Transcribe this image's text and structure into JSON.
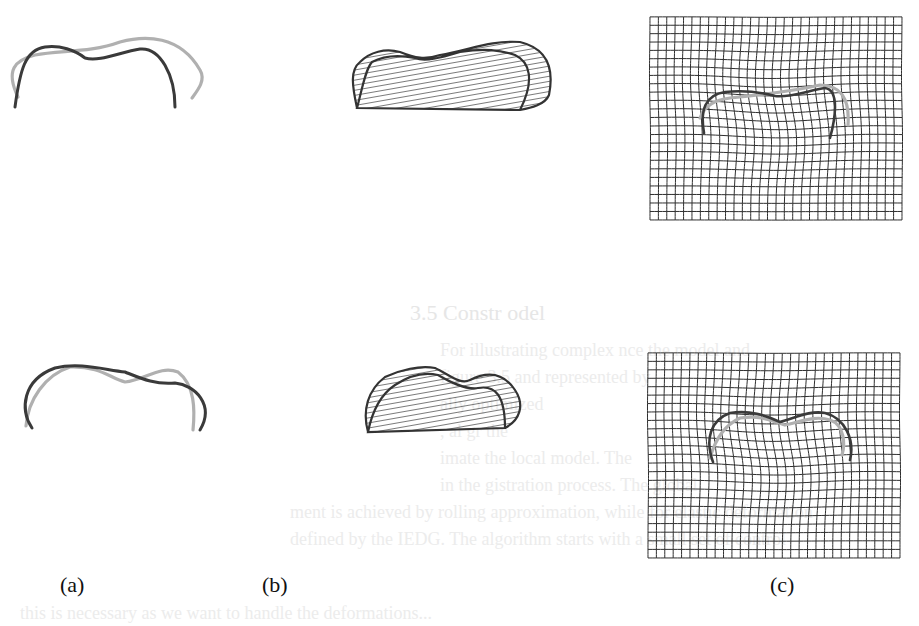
{
  "figure": {
    "panel_labels": [
      "(a)",
      "(b)",
      "(c)"
    ],
    "colors": {
      "source_curve": "#3a3a3a",
      "target_curve": "#b0b0b0",
      "grid_line": "#2e2e2e",
      "hatch": "#333333",
      "bleed_text": "#ececec"
    },
    "grid": {
      "columns": 30,
      "rows": 24
    },
    "rows": [
      {
        "name": "row-1",
        "panel_a": {
          "source_path": "M15,107 C20,70 25,50 45,47 C60,45 75,50 85,58 C100,62 120,52 140,49 C160,47 175,75 175,107",
          "target_path": "M18,97 C5,70 15,60 35,55 C60,50 90,53 120,42 C145,35 180,35 200,70 C206,80 198,90 192,98"
        },
        "panel_b": {
          "outer_path": "M357,108 C352,85 350,70 360,62 C370,52 385,48 400,52 C415,58 425,60 440,55 C470,50 490,40 520,42 C545,48 555,65 549,95 C545,105 530,108 520,110",
          "inner_path": "M357,108 C362,90 365,70 372,62 C385,55 400,55 415,58 C425,62 440,58 460,52 C485,48 500,50 515,55 C530,62 535,80 520,110"
        },
        "panel_c": {
          "x": 650,
          "y": 17,
          "w": 252,
          "h": 203,
          "source_path": "M704,133 C700,110 705,95 725,92 C745,90 760,92 775,96 C790,98 810,90 825,88 C840,90 835,120 830,138",
          "target_path": "M700,118 C705,105 715,100 730,98 C760,95 790,92 820,85 C840,85 850,98 848,125"
        }
      },
      {
        "name": "row-2",
        "panel_a": {
          "source_path": "M32,428 C20,410 22,380 55,368 C80,362 105,370 125,372 C140,378 155,385 175,383 C195,385 215,405 200,430",
          "target_path": "M26,426 C28,400 45,375 70,367 C100,366 110,378 125,382 C145,380 160,365 178,372 C195,385 195,410 193,430"
        },
        "panel_b": {
          "outer_path": "M368,432 C362,410 368,390 385,377 C400,370 420,365 435,368 C450,375 460,385 470,380 C490,370 505,375 515,390 C525,405 520,420 505,428",
          "inner_path": "M368,432 C372,412 380,395 395,385 C410,375 425,372 438,375 C450,382 465,390 478,388 C495,385 505,395 505,428"
        },
        "panel_c": {
          "x": 648,
          "y": 353,
          "w": 252,
          "h": 205,
          "source_path": "M713,462 C705,440 710,420 730,413 C750,410 765,415 780,422 C795,418 810,410 825,413 C845,418 855,440 850,460",
          "target_path": "M710,458 C715,440 725,425 740,418 C760,415 770,420 785,425 C800,422 815,415 830,420 C845,425 845,445 842,455"
        }
      }
    ],
    "bleed_through_text": {
      "heading": "3.5 Constr          odel",
      "lines": [
        "For illustrating complex              nce the model and",
        "figure 3.5 and            represented by",
        "            ally         optimized",
        "          ,             al gr         the",
        "         imate the                  local model. The",
        "         in the                      gistration process. The global",
        "  ment is achieved by rolling approximation, while for elastic deformation",
        "  defined by the IEDG. The algorithm starts with a small set of control",
        "  this    is necessary as we want to handle the deformations..."
      ]
    }
  }
}
